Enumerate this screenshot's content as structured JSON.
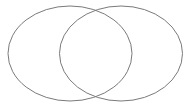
{
  "diagram": {
    "type": "venn",
    "sets": [
      {
        "id": "left",
        "label": "",
        "cx": 70,
        "cy": 53.5,
        "rx": 62,
        "ry": 47.5
      },
      {
        "id": "right",
        "label": "",
        "cx": 121,
        "cy": 53.5,
        "rx": 61.5,
        "ry": 47.5
      }
    ],
    "stroke_color": "#7a7a7a",
    "background": "#ffffff"
  }
}
